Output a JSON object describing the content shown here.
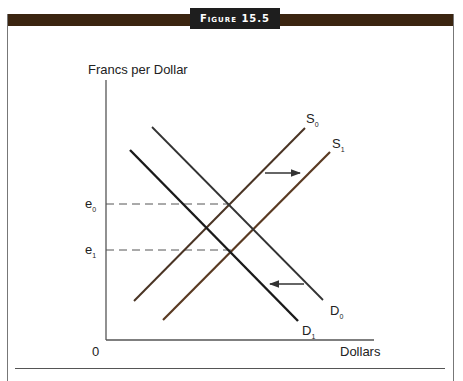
{
  "figure": {
    "title": "Figure 15.5",
    "frame_color": "#3b2510",
    "tab_color": "#1e1e1e"
  },
  "axes": {
    "ylabel": "Francs per Dollar",
    "xlabel": "Dollars",
    "origin": "0"
  },
  "levels": {
    "e0": {
      "base": "e",
      "sub": "0"
    },
    "e1": {
      "base": "e",
      "sub": "1"
    }
  },
  "curves": {
    "S0": {
      "base": "S",
      "sub": "0",
      "color": "#4a3424"
    },
    "S1": {
      "base": "S",
      "sub": "1",
      "color": "#5a3a22"
    },
    "D0": {
      "base": "D",
      "sub": "0",
      "color": "#333333"
    },
    "D1": {
      "base": "D",
      "sub": "1",
      "color": "#1a1a1a"
    }
  },
  "shifts": {
    "supply": "right",
    "demand": "left"
  }
}
